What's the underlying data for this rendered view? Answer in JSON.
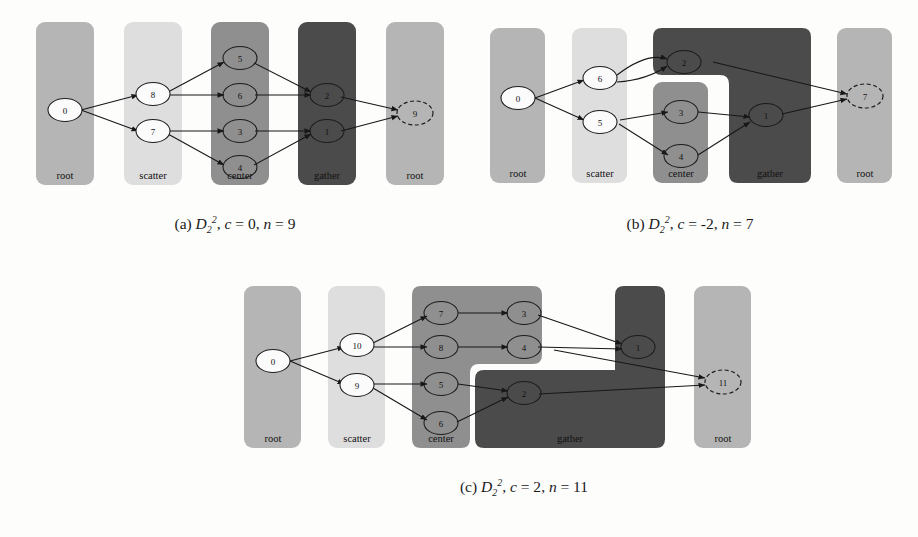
{
  "figure": {
    "title_domain": "process-group-diagrams",
    "region_labels": [
      "root",
      "scatter",
      "center",
      "gather",
      "root"
    ],
    "colors": {
      "root": "#b5b5b5",
      "scatter": "#dedede",
      "center": "#8f8f8f",
      "gather": "#4b4b4b",
      "edge": "#171717",
      "page_bg": "#fdfdfc"
    }
  },
  "panels": [
    {
      "id": "a",
      "caption": {
        "letter": "(a)",
        "symbol": "D",
        "sub": "2",
        "sup": "2",
        "c_label": "c",
        "c_value": "= 0",
        "n_label": "n",
        "n_value": "= 9",
        "full": "(a) D_2^2, c = 0, n = 9"
      },
      "regions": [
        {
          "name": "root",
          "label": "root",
          "color": "#b5b5b5"
        },
        {
          "name": "scatter",
          "label": "scatter",
          "color": "#dedede"
        },
        {
          "name": "center",
          "label": "center",
          "color": "#8f8f8f"
        },
        {
          "name": "gather",
          "label": "gather",
          "color": "#4b4b4b"
        },
        {
          "name": "root2",
          "label": "root",
          "color": "#b5b5b5"
        }
      ],
      "nodes": [
        {
          "id": "0",
          "label": "0",
          "region": "root",
          "style": "white"
        },
        {
          "id": "8",
          "label": "8",
          "region": "scatter",
          "style": "white"
        },
        {
          "id": "7",
          "label": "7",
          "region": "scatter",
          "style": "white"
        },
        {
          "id": "5",
          "label": "5",
          "region": "center",
          "style": "open"
        },
        {
          "id": "6",
          "label": "6",
          "region": "center",
          "style": "open"
        },
        {
          "id": "3",
          "label": "3",
          "region": "center",
          "style": "open"
        },
        {
          "id": "4",
          "label": "4",
          "region": "center",
          "style": "open"
        },
        {
          "id": "2",
          "label": "2",
          "region": "gather",
          "style": "open"
        },
        {
          "id": "1",
          "label": "1",
          "region": "gather",
          "style": "open"
        },
        {
          "id": "9",
          "label": "9",
          "region": "root2",
          "style": "dashed"
        }
      ],
      "edges": [
        [
          "0",
          "8"
        ],
        [
          "0",
          "7"
        ],
        [
          "8",
          "5"
        ],
        [
          "8",
          "6"
        ],
        [
          "7",
          "3"
        ],
        [
          "7",
          "4"
        ],
        [
          "5",
          "2"
        ],
        [
          "6",
          "2"
        ],
        [
          "3",
          "1"
        ],
        [
          "4",
          "1"
        ],
        [
          "2",
          "9"
        ],
        [
          "1",
          "9"
        ]
      ]
    },
    {
      "id": "b",
      "caption": {
        "letter": "(b)",
        "symbol": "D",
        "sub": "2",
        "sup": "2",
        "c_label": "c",
        "c_value": "= -2",
        "n_label": "n",
        "n_value": "= 7",
        "full": "(b) D_2^2, c = -2, n = 7"
      },
      "regions": [
        {
          "name": "root",
          "label": "root",
          "color": "#b5b5b5"
        },
        {
          "name": "scatter",
          "label": "scatter",
          "color": "#dedede"
        },
        {
          "name": "center",
          "label": "center",
          "color": "#8f8f8f"
        },
        {
          "name": "gather",
          "label": "gather",
          "color": "#4b4b4b"
        },
        {
          "name": "root2",
          "label": "root",
          "color": "#b5b5b5"
        }
      ],
      "nodes": [
        {
          "id": "0",
          "label": "0",
          "region": "root",
          "style": "white"
        },
        {
          "id": "6",
          "label": "6",
          "region": "scatter",
          "style": "white"
        },
        {
          "id": "5",
          "label": "5",
          "region": "scatter",
          "style": "white"
        },
        {
          "id": "2",
          "label": "2",
          "region": "gather",
          "style": "open"
        },
        {
          "id": "3",
          "label": "3",
          "region": "center",
          "style": "open"
        },
        {
          "id": "4",
          "label": "4",
          "region": "center",
          "style": "open"
        },
        {
          "id": "1",
          "label": "1",
          "region": "gather",
          "style": "open"
        },
        {
          "id": "7",
          "label": "7",
          "region": "root2",
          "style": "dashed"
        }
      ],
      "edges": [
        [
          "0",
          "6"
        ],
        [
          "0",
          "5"
        ],
        [
          "6",
          "2"
        ],
        [
          "6",
          "2"
        ],
        [
          "5",
          "3"
        ],
        [
          "5",
          "4"
        ],
        [
          "3",
          "1"
        ],
        [
          "4",
          "1"
        ],
        [
          "2",
          "7"
        ],
        [
          "1",
          "7"
        ]
      ]
    },
    {
      "id": "c",
      "caption": {
        "letter": "(c)",
        "symbol": "D",
        "sub": "2",
        "sup": "2",
        "c_label": "c",
        "c_value": "= 2",
        "n_label": "n",
        "n_value": "= 11",
        "full": "(c) D_2^2, c = 2, n = 11"
      },
      "regions": [
        {
          "name": "root",
          "label": "root",
          "color": "#b5b5b5"
        },
        {
          "name": "scatter",
          "label": "scatter",
          "color": "#dedede"
        },
        {
          "name": "center",
          "label": "center",
          "color": "#8f8f8f"
        },
        {
          "name": "gather",
          "label": "gather",
          "color": "#4b4b4b"
        },
        {
          "name": "root2",
          "label": "root",
          "color": "#b5b5b5"
        }
      ],
      "nodes": [
        {
          "id": "0",
          "label": "0",
          "region": "root",
          "style": "white"
        },
        {
          "id": "10",
          "label": "10",
          "region": "scatter",
          "style": "white"
        },
        {
          "id": "9",
          "label": "9",
          "region": "scatter",
          "style": "white"
        },
        {
          "id": "7",
          "label": "7",
          "region": "center",
          "style": "open"
        },
        {
          "id": "8",
          "label": "8",
          "region": "center",
          "style": "open"
        },
        {
          "id": "5",
          "label": "5",
          "region": "center",
          "style": "open"
        },
        {
          "id": "6",
          "label": "6",
          "region": "center",
          "style": "open"
        },
        {
          "id": "3",
          "label": "3",
          "region": "center",
          "style": "open"
        },
        {
          "id": "4",
          "label": "4",
          "region": "center",
          "style": "open"
        },
        {
          "id": "1",
          "label": "1",
          "region": "gather",
          "style": "open"
        },
        {
          "id": "2",
          "label": "2",
          "region": "gather",
          "style": "open"
        },
        {
          "id": "11",
          "label": "11",
          "region": "root2",
          "style": "dashed"
        }
      ],
      "edges": [
        [
          "0",
          "10"
        ],
        [
          "0",
          "9"
        ],
        [
          "10",
          "7"
        ],
        [
          "10",
          "8"
        ],
        [
          "9",
          "5"
        ],
        [
          "9",
          "6"
        ],
        [
          "7",
          "3"
        ],
        [
          "8",
          "4"
        ],
        [
          "5",
          "2"
        ],
        [
          "6",
          "2"
        ],
        [
          "3",
          "1"
        ],
        [
          "4",
          "1"
        ],
        [
          "1",
          "11"
        ],
        [
          "2",
          "11"
        ]
      ]
    }
  ]
}
